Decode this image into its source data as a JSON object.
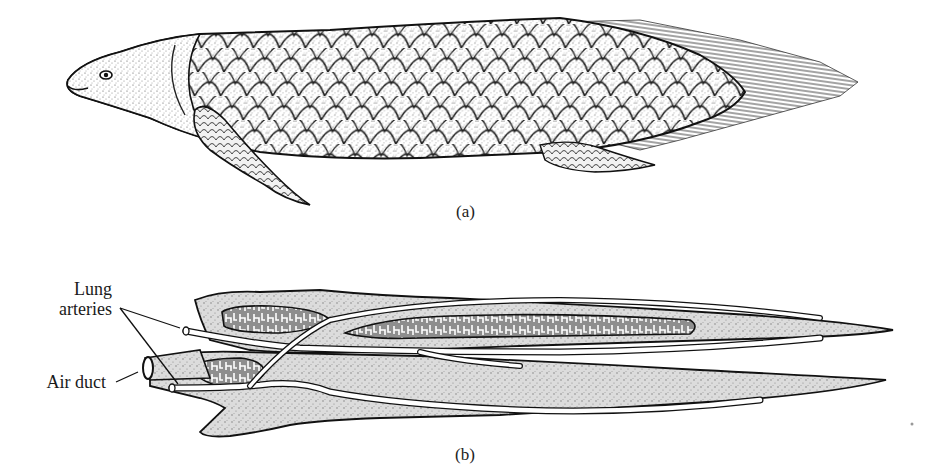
{
  "figure": {
    "panels": [
      {
        "id": "a",
        "caption": "(a)",
        "subject": "lungfish-illustration"
      },
      {
        "id": "b",
        "caption": "(b)",
        "subject": "lungs-diagram"
      }
    ],
    "labels": {
      "lung_arteries_line1": "Lung",
      "lung_arteries_line2": "arteries",
      "air_duct": "Air duct"
    },
    "colors": {
      "outline": "#1a1a1a",
      "body_stipple": "#e9e9e9",
      "lung_tissue": "#d6d6d6",
      "lung_cavity": "#8d8d8d",
      "vessel": "#ffffff",
      "background": "#ffffff"
    }
  }
}
